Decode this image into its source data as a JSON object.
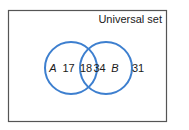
{
  "diagram": {
    "type": "venn",
    "universe_label": "Universal set",
    "sets": [
      {
        "name": "A",
        "only_count": "17"
      },
      {
        "name": "B",
        "only_count": "34"
      }
    ],
    "intersection_count": "18",
    "outside_count": "31",
    "colors": {
      "circle_stroke": "#3d7fcf",
      "border": "#555555",
      "text": "#1a1a1a"
    }
  }
}
